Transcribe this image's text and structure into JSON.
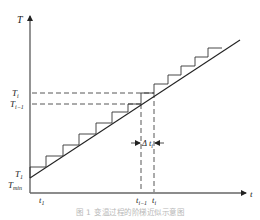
{
  "diagram": {
    "type": "staircase-approximation",
    "y_axis": {
      "label": "T"
    },
    "x_axis": {
      "label": "t"
    },
    "y_labels": {
      "Ti": {
        "main": "T",
        "sub": "i"
      },
      "Ti_minus_1": {
        "main": "T",
        "sub": "i−1"
      },
      "T1": {
        "main": "T",
        "sub": "1"
      },
      "Tmin": {
        "main": "T",
        "sub": "min"
      }
    },
    "x_labels": {
      "t1": {
        "main": "t",
        "sub": "1"
      },
      "ti_minus_1": {
        "main": "t",
        "sub": "i−1"
      },
      "ti": {
        "main": "t",
        "sub": "i"
      }
    },
    "interval_label": {
      "main": "Δ t",
      "sub": "i"
    },
    "line": {
      "from": [
        30,
        178
      ],
      "to": [
        240,
        40
      ]
    },
    "step_count": 16,
    "colors": {
      "axis": "#555555",
      "line": "#222222",
      "dash": "#444444"
    }
  },
  "caption": "图 1   变温过程的阶梯近似示意图"
}
